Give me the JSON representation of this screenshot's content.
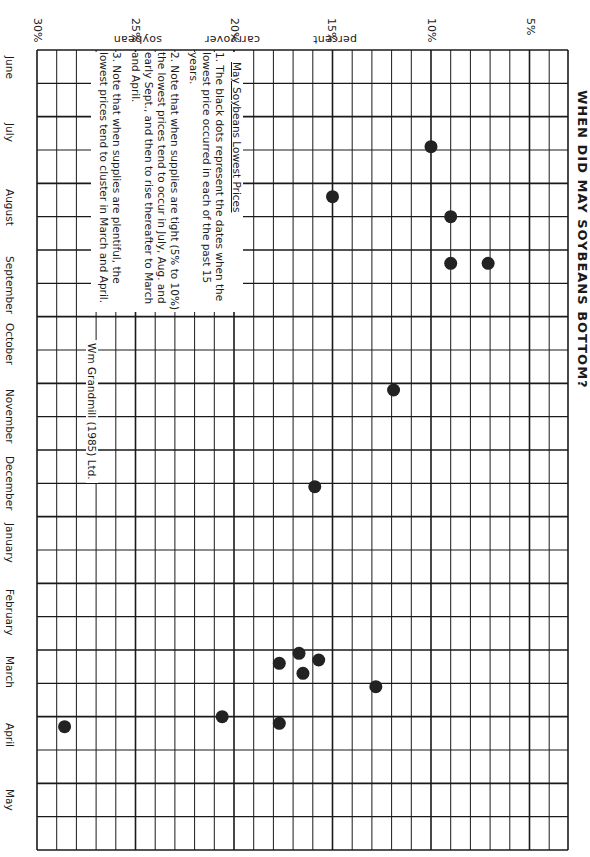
{
  "chart_data": {
    "type": "scatter",
    "title": "WHEN DID MAY SOYBEANS BOTTOM?",
    "orientation": "rotated 90° clockwise (months run top-to-bottom, carryover % runs right-to-left)",
    "xlabel": "soybean carryover percent",
    "ylabel": "Month",
    "x_ticks": [
      "30%",
      "25%",
      "20%",
      "15%",
      "10%",
      "5%"
    ],
    "x_tick_values": [
      30,
      25,
      20,
      15,
      10,
      5
    ],
    "xlim": [
      2,
      31
    ],
    "months": [
      "June",
      "July",
      "August",
      "September",
      "October",
      "November",
      "December",
      "January",
      "February",
      "March",
      "April",
      "May"
    ],
    "grid": true,
    "points": [
      {
        "month": "July",
        "month_pos": 1.45,
        "carryover_pct": 10.0
      },
      {
        "month": "August",
        "month_pos": 2.5,
        "carryover_pct": 9.0
      },
      {
        "month": "August",
        "month_pos": 2.2,
        "carryover_pct": 15.0
      },
      {
        "month": "August",
        "month_pos": 3.2,
        "carryover_pct": 9.0
      },
      {
        "month": "August",
        "month_pos": 3.2,
        "carryover_pct": 7.1
      },
      {
        "month": "October",
        "month_pos": 5.1,
        "carryover_pct": 11.9
      },
      {
        "month": "December",
        "month_pos": 6.55,
        "carryover_pct": 15.9
      },
      {
        "month": "March",
        "month_pos": 9.05,
        "carryover_pct": 16.7
      },
      {
        "month": "March",
        "month_pos": 9.15,
        "carryover_pct": 15.7
      },
      {
        "month": "March",
        "month_pos": 9.2,
        "carryover_pct": 17.7
      },
      {
        "month": "March",
        "month_pos": 9.35,
        "carryover_pct": 16.5
      },
      {
        "month": "March",
        "month_pos": 9.55,
        "carryover_pct": 12.8
      },
      {
        "month": "March",
        "month_pos": 10.0,
        "carryover_pct": 20.6
      },
      {
        "month": "March",
        "month_pos": 10.1,
        "carryover_pct": 17.7
      },
      {
        "month": "March",
        "month_pos": 10.15,
        "carryover_pct": 28.6
      }
    ],
    "annotations": [
      "May Soybeans Lowest Prices",
      "1. The black dots represent the dates when the lowest price occurred in each of the past 15 years.",
      "2. Note that when supplies are tight (5% to 10%) the lowest prices tend to occur in July, Aug. and early Sept., and then to rise thereafter to March and April.",
      "3. Note that when supplies are plentiful, the lowest prices tend to cluster in March and April.",
      "Wm Grandmill (1985) Ltd."
    ]
  },
  "title": "WHEN DID MAY SOYBEANS BOTTOM?",
  "axis": {
    "pct_labels": [
      "30%",
      "25%",
      "20%",
      "15%",
      "10%",
      "5%"
    ],
    "words": [
      "soybean",
      "carryover",
      "percent"
    ]
  },
  "months": [
    "June",
    "July",
    "August",
    "September",
    "October",
    "November",
    "December",
    "January",
    "February",
    "March",
    "April",
    "May"
  ],
  "notes": {
    "heading": "May Soybeans Lowest Prices",
    "items": [
      "1. The black dots represent the dates when the lowest price occurred in each of the past 15 years.",
      "2. Note that when supplies are tight (5% to 10%) the lowest prices tend to occur in July, Aug. and early Sept., and then to rise thereafter to March and April.",
      "3. Note that when supplies are plentiful, the lowest prices tend to cluster in March and April."
    ]
  },
  "credit": "Wm Grandmill (1985) Ltd.",
  "colors": {
    "ink": "#1a1a1a",
    "paper": "#ffffff",
    "dot": "#222222"
  }
}
